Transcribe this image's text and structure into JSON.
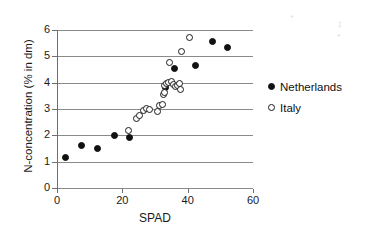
{
  "chart_data": {
    "type": "scatter",
    "title": "",
    "xlabel": "SPAD",
    "ylabel": "N-concentration (% in dm)",
    "xlim": [
      0,
      60
    ],
    "ylim": [
      0,
      6
    ],
    "xticks": [
      0,
      20,
      40,
      60
    ],
    "yticks": [
      0,
      1,
      2,
      3,
      4,
      5,
      6
    ],
    "grid": "horizontal",
    "legend_position": "right",
    "series": [
      {
        "name": "Netherlands",
        "marker": "filled-circle",
        "color": "#111111",
        "points": [
          [
            2.6,
            1.17
          ],
          [
            7.5,
            1.6
          ],
          [
            12.4,
            1.5
          ],
          [
            17.6,
            2.0
          ],
          [
            22.3,
            1.9
          ],
          [
            33.3,
            3.8
          ],
          [
            36.0,
            4.55
          ],
          [
            42.4,
            4.67
          ],
          [
            47.6,
            5.55
          ],
          [
            52.3,
            5.32
          ]
        ]
      },
      {
        "name": "Italy",
        "marker": "open-circle",
        "color": "#1a1a1a",
        "points": [
          [
            21.9,
            2.17
          ],
          [
            24.3,
            2.63
          ],
          [
            25.4,
            2.74
          ],
          [
            26.6,
            2.95
          ],
          [
            27.4,
            3.02
          ],
          [
            28.3,
            3.0
          ],
          [
            30.8,
            2.92
          ],
          [
            31.5,
            3.12
          ],
          [
            32.2,
            3.17
          ],
          [
            32.6,
            3.55
          ],
          [
            33.0,
            3.62
          ],
          [
            32.9,
            3.88
          ],
          [
            33.6,
            3.95
          ],
          [
            34.2,
            4.02
          ],
          [
            35.0,
            4.03
          ],
          [
            35.6,
            3.93
          ],
          [
            36.2,
            3.85
          ],
          [
            36.8,
            3.9
          ],
          [
            37.4,
            3.95
          ],
          [
            37.8,
            3.75
          ],
          [
            34.4,
            4.77
          ],
          [
            38.2,
            5.2
          ],
          [
            40.6,
            5.7
          ]
        ]
      }
    ]
  },
  "legend": {
    "items": [
      {
        "label": "Netherlands",
        "marker": "filled-circle"
      },
      {
        "label": "Italy",
        "marker": "open-circle"
      }
    ]
  },
  "axes": {
    "x_title": "SPAD",
    "y_title": "N-concentration (% in dm)",
    "x_tick_labels": [
      "0",
      "20",
      "40",
      "60"
    ],
    "y_tick_labels": [
      "0",
      "1",
      "2",
      "3",
      "4",
      "5",
      "6"
    ]
  }
}
